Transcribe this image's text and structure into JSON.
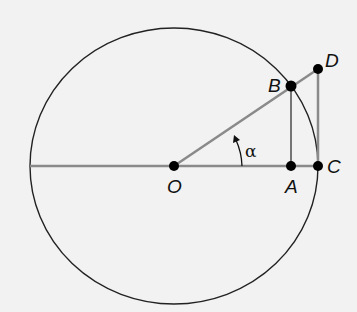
{
  "diagram": {
    "type": "unit-circle-trigonometry",
    "colors": {
      "background": "#f2f2f2",
      "circle": "#222222",
      "gray_lines": "#8a8a8a",
      "points": "#000000"
    },
    "points": {
      "O": {
        "label": "O",
        "x": 174,
        "y": 166
      },
      "A": {
        "label": "A",
        "x": 291,
        "y": 166
      },
      "B": {
        "label": "B",
        "x": 291,
        "y": 86
      },
      "C": {
        "label": "C",
        "x": 318,
        "y": 166
      },
      "D": {
        "label": "D",
        "x": 318,
        "y": 69
      }
    },
    "angle": {
      "label": "α",
      "vertex": "O"
    },
    "segments": [
      "diameter-left-to-C",
      "O-D",
      "B-A",
      "D-C"
    ]
  }
}
